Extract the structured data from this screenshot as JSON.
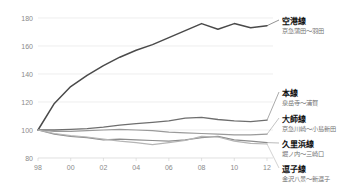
{
  "chart_data": {
    "type": "line",
    "title": "",
    "subtitle": "",
    "xlabel": "",
    "ylabel": "",
    "xlim": [
      1998,
      2012
    ],
    "ylim": [
      80,
      180
    ],
    "yticks": [
      80,
      100,
      120,
      140,
      160,
      180
    ],
    "ytick_labels": [
      "80",
      "100",
      "120",
      "140",
      "160",
      "180"
    ],
    "xticks": [
      1998,
      2000,
      2002,
      2004,
      2006,
      2008,
      2010,
      2012
    ],
    "xtick_labels": [
      "98",
      "00",
      "02",
      "04",
      "06",
      "08",
      "10",
      "12"
    ],
    "x": [
      1998,
      1999,
      2000,
      2001,
      2002,
      2003,
      2004,
      2005,
      2006,
      2007,
      2008,
      2009,
      2010,
      2011,
      2012
    ],
    "grid": true,
    "grid_axis": "y",
    "legend_position": "right-inline-labels",
    "baseline_note": "1998 = 100",
    "series": [
      {
        "name": "空港線",
        "sub": "京急蒲田〜羽田",
        "color": "#4a4a4a",
        "width": 1.5,
        "values": [
          100,
          119,
          131,
          139,
          146,
          152,
          157,
          161,
          166,
          171,
          176,
          172,
          176,
          173,
          174.5
        ]
      },
      {
        "name": "本線",
        "sub": "泉岳寺〜浦賀",
        "color": "#6e6e6e",
        "width": 1.3,
        "values": [
          100,
          100,
          100.5,
          101,
          102,
          103.5,
          104.5,
          105.5,
          106.5,
          108.5,
          109,
          107.5,
          106.5,
          106,
          107
        ]
      },
      {
        "name": "大師線",
        "sub": "京急川崎〜小島新田",
        "color": "#9a9a9a",
        "width": 1.2,
        "values": [
          100,
          99,
          99,
          99.5,
          100,
          100.5,
          100,
          99.5,
          98.5,
          98,
          97.5,
          97,
          96.5,
          96.5,
          97
        ]
      },
      {
        "name": "久里浜線",
        "sub": "堀ノ内〜三崎口",
        "color": "#8c8c8c",
        "width": 1.2,
        "values": [
          100,
          97,
          95.5,
          94.5,
          93,
          93.5,
          93,
          92.5,
          92,
          93,
          94.5,
          95.5,
          93,
          92,
          91
        ]
      },
      {
        "name": "逗子線",
        "sub": "金沢八景〜新逗子",
        "color": "#b5b5b5",
        "width": 1.2,
        "values": [
          100,
          97.5,
          96,
          95,
          93.5,
          92,
          91,
          89.5,
          91,
          92.5,
          95.5,
          95,
          92,
          90.5,
          90
        ]
      }
    ]
  }
}
